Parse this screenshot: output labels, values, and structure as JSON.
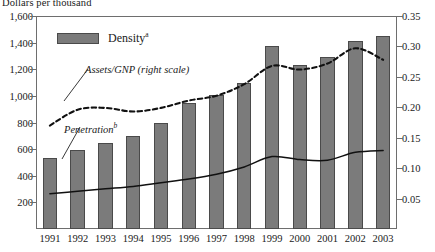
{
  "axis_title": "Dollars per thousand",
  "legend": {
    "density_label": "Density",
    "density_sup": "a"
  },
  "annotations": {
    "assets": "Assets/GNP (right scale)",
    "penetration": "Penetration",
    "penetration_sup": "b"
  },
  "colors": {
    "bar_fill": "#7b7b7b",
    "bar_stroke": "#4a4a4a",
    "axis": "#6e6e6e",
    "line": "#111111"
  },
  "chart_data": {
    "type": "bar",
    "title": "Dollars per thousand",
    "xlabel": "",
    "ylabel": "Dollars per thousand",
    "y2label": "",
    "grid": false,
    "legend_position": "top-left",
    "categories": [
      "1991",
      "1992",
      "1993",
      "1994",
      "1995",
      "1996",
      "1997",
      "1998",
      "1999",
      "2000",
      "2001",
      "2002",
      "2003"
    ],
    "ylim": [
      0,
      1600
    ],
    "yticks": [
      "200",
      "400",
      "600",
      "800",
      "1,000",
      "1,200",
      "1,400",
      "1,600"
    ],
    "ytick_values": [
      200,
      400,
      600,
      800,
      1000,
      1200,
      1400,
      1600
    ],
    "y2lim": [
      0,
      0.35
    ],
    "y2ticks": [
      "0.05",
      "0.10",
      "0.15",
      "0.20",
      "0.25",
      "0.30",
      "0.35"
    ],
    "y2tick_values": [
      0.05,
      0.1,
      0.15,
      0.2,
      0.25,
      0.3,
      0.35
    ],
    "series": [
      {
        "name": "Density",
        "type": "bar",
        "axis": "left",
        "values": [
          530,
          590,
          645,
          700,
          800,
          945,
          1010,
          1095,
          1375,
          1235,
          1290,
          1410,
          1450
        ]
      },
      {
        "name": "Assets/GNP (right scale)",
        "type": "line",
        "style": "dashed",
        "axis": "right",
        "values": [
          0.17,
          0.196,
          0.199,
          0.193,
          0.199,
          0.211,
          0.219,
          0.238,
          0.268,
          0.262,
          0.272,
          0.297,
          0.278
        ]
      },
      {
        "name": "Penetration",
        "type": "line",
        "style": "solid",
        "axis": "right",
        "values": [
          0.058,
          0.062,
          0.066,
          0.07,
          0.076,
          0.082,
          0.09,
          0.102,
          0.119,
          0.114,
          0.113,
          0.126,
          0.129
        ]
      }
    ]
  }
}
